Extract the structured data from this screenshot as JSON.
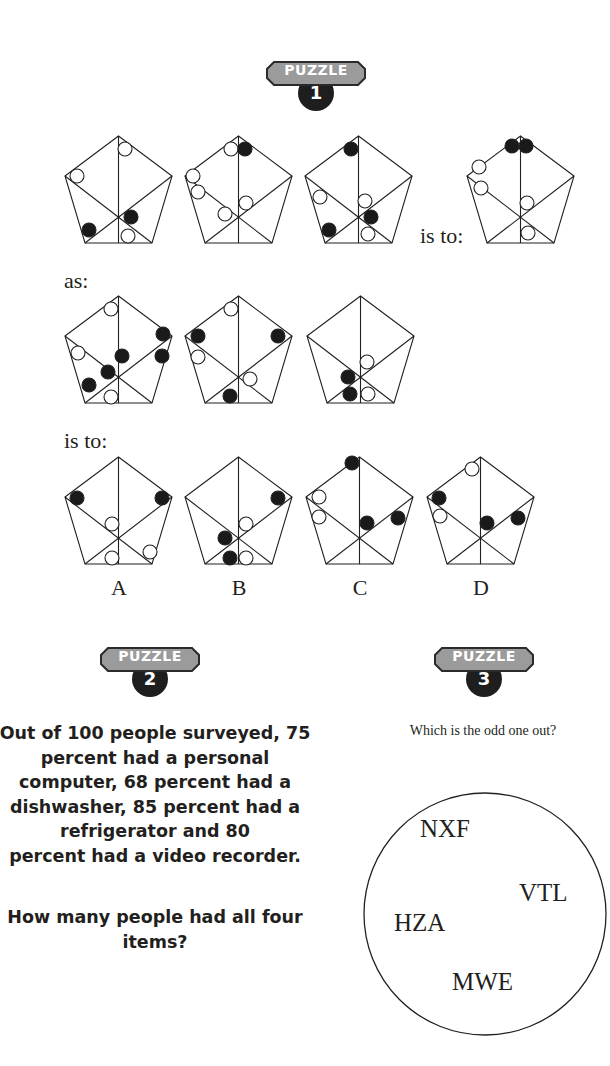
{
  "colors": {
    "badge_fill": "#9b9b9b",
    "badge_border": "#2b2b2b",
    "circle_badge": "#1e1e1e",
    "ink": "#231f20"
  },
  "puzzle1": {
    "badge": {
      "label": "PUZZLE",
      "number": "1"
    },
    "is_to_1": "is to:",
    "as": "as:",
    "is_to_2": "is to:",
    "row1": [
      {
        "x": 65,
        "y": 136,
        "circles": [
          {
            "x": 60,
            "y": 13,
            "f": 0
          },
          {
            "x": 12,
            "y": 40,
            "f": 0
          },
          {
            "x": 24,
            "y": 94,
            "f": 1
          },
          {
            "x": 66,
            "y": 81,
            "f": 1
          },
          {
            "x": 63,
            "y": 100,
            "f": 0
          }
        ]
      },
      {
        "x": 185,
        "y": 136,
        "circles": [
          {
            "x": 46,
            "y": 13,
            "f": 0
          },
          {
            "x": 60,
            "y": 13,
            "f": 1
          },
          {
            "x": 8,
            "y": 40,
            "f": 0
          },
          {
            "x": 13,
            "y": 56,
            "f": 0
          },
          {
            "x": 40,
            "y": 78,
            "f": 0
          },
          {
            "x": 61,
            "y": 67,
            "f": 0
          }
        ]
      },
      {
        "x": 305,
        "y": 136,
        "circles": [
          {
            "x": 46,
            "y": 13,
            "f": 1
          },
          {
            "x": 15,
            "y": 61,
            "f": 0
          },
          {
            "x": 24,
            "y": 94,
            "f": 1
          },
          {
            "x": 60,
            "y": 65,
            "f": 0
          },
          {
            "x": 66,
            "y": 81,
            "f": 1
          },
          {
            "x": 63,
            "y": 98,
            "f": 0
          }
        ]
      },
      {
        "x": 467,
        "y": 136,
        "circles": [
          {
            "x": 45,
            "y": 10,
            "f": 1
          },
          {
            "x": 59,
            "y": 10,
            "f": 1
          },
          {
            "x": 12,
            "y": 31,
            "f": 0
          },
          {
            "x": 14,
            "y": 52,
            "f": 0
          },
          {
            "x": 60,
            "y": 67,
            "f": 0
          },
          {
            "x": 61,
            "y": 97,
            "f": 0
          }
        ]
      }
    ],
    "row2": [
      {
        "x": 65,
        "y": 296,
        "circles": [
          {
            "x": 46,
            "y": 13,
            "f": 0
          },
          {
            "x": 13,
            "y": 57,
            "f": 0
          },
          {
            "x": 43,
            "y": 76,
            "f": 1
          },
          {
            "x": 24,
            "y": 89,
            "f": 1
          },
          {
            "x": 46,
            "y": 101,
            "f": 0
          },
          {
            "x": 98,
            "y": 38,
            "f": 1
          },
          {
            "x": 97,
            "y": 60,
            "f": 1
          },
          {
            "x": 57,
            "y": 60,
            "f": 1
          }
        ]
      },
      {
        "x": 185,
        "y": 296,
        "circles": [
          {
            "x": 46,
            "y": 13,
            "f": 0
          },
          {
            "x": 13,
            "y": 40,
            "f": 1
          },
          {
            "x": 13,
            "y": 61,
            "f": 0
          },
          {
            "x": 93,
            "y": 40,
            "f": 1
          },
          {
            "x": 65,
            "y": 83,
            "f": 0
          },
          {
            "x": 45,
            "y": 100,
            "f": 1
          }
        ]
      },
      {
        "x": 307,
        "y": 296,
        "circles": [
          {
            "x": 60,
            "y": 66,
            "f": 0
          },
          {
            "x": 41,
            "y": 81,
            "f": 1
          },
          {
            "x": 43,
            "y": 98,
            "f": 1
          },
          {
            "x": 61,
            "y": 98,
            "f": 0
          }
        ]
      }
    ],
    "row3": [
      {
        "x": 65,
        "y": 457,
        "letter": "A",
        "circles": [
          {
            "x": 12,
            "y": 41,
            "f": 1
          },
          {
            "x": 97,
            "y": 41,
            "f": 1
          },
          {
            "x": 47,
            "y": 67,
            "f": 0
          },
          {
            "x": 47,
            "y": 101,
            "f": 0
          },
          {
            "x": 85,
            "y": 95,
            "f": 0
          }
        ]
      },
      {
        "x": 185,
        "y": 457,
        "letter": "B",
        "circles": [
          {
            "x": 93,
            "y": 41,
            "f": 1
          },
          {
            "x": 61,
            "y": 67,
            "f": 0
          },
          {
            "x": 40,
            "y": 81,
            "f": 1
          },
          {
            "x": 45,
            "y": 101,
            "f": 1
          },
          {
            "x": 61,
            "y": 101,
            "f": 0
          }
        ]
      },
      {
        "x": 306,
        "y": 457,
        "letter": "C",
        "circles": [
          {
            "x": 46,
            "y": 6,
            "f": 1
          },
          {
            "x": 13,
            "y": 40,
            "f": 0
          },
          {
            "x": 13,
            "y": 60,
            "f": 0
          },
          {
            "x": 61,
            "y": 66,
            "f": 1
          },
          {
            "x": 92,
            "y": 61,
            "f": 1
          }
        ]
      },
      {
        "x": 427,
        "y": 457,
        "letter": "D",
        "circles": [
          {
            "x": 45,
            "y": 12,
            "f": 0
          },
          {
            "x": 12,
            "y": 41,
            "f": 1
          },
          {
            "x": 13,
            "y": 59,
            "f": 0
          },
          {
            "x": 60,
            "y": 66,
            "f": 1
          },
          {
            "x": 91,
            "y": 61,
            "f": 1
          }
        ]
      }
    ]
  },
  "puzzle2": {
    "badge": {
      "label": "PUZZLE",
      "number": "2"
    },
    "text_lines": [
      "Out of 100 people surveyed, 75",
      "percent had a personal",
      "computer, 68 percent had a",
      "dishwasher, 85 percent had a",
      "refrigerator and 80",
      "percent had a video recorder."
    ],
    "question_lines": [
      "How many people had all four",
      "items?"
    ]
  },
  "puzzle3": {
    "badge": {
      "label": "PUZZLE",
      "number": "3"
    },
    "question": "Which is the odd one out?",
    "codes": [
      "NXF",
      "VTL",
      "HZA",
      "MWE"
    ]
  }
}
